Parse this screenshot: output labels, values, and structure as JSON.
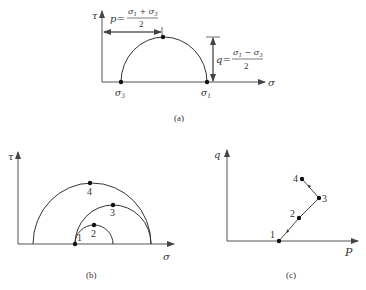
{
  "panels": {
    "a": {
      "caption": "(a)",
      "y_axis_label": "τ",
      "x_axis_label": "σ",
      "sigma3_label": "σ",
      "sigma3_sub": "3",
      "sigma1_label": "σ",
      "sigma1_sub": "1",
      "p_label": "p=",
      "p_numerator": "σ",
      "p_num_sub1": "1",
      "p_num_op": " + σ",
      "p_num_sub3": "3",
      "p_denominator": "2",
      "q_label": "q=",
      "q_numerator": "σ",
      "q_num_sub1": "1",
      "q_num_op": " − σ",
      "q_num_sub3": "3",
      "q_denominator": "2"
    },
    "b": {
      "caption": "(b)",
      "y_axis_label": "τ",
      "x_axis_label": "σ",
      "point_labels": [
        "1",
        "2",
        "3",
        "4"
      ]
    },
    "c": {
      "caption": "(c)",
      "y_axis_label": "q",
      "x_axis_label": "P",
      "point_labels": [
        "1",
        "2",
        "3",
        "4"
      ]
    }
  }
}
